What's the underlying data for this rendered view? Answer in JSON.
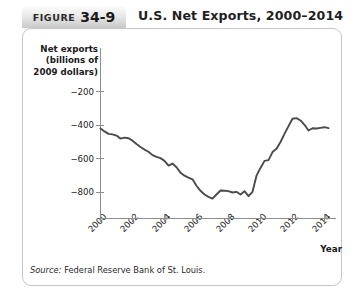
{
  "header": {
    "badge_word": "FIGURE",
    "badge_number": "34-9",
    "title": "U.S. Net Exports, 2000–2014"
  },
  "source": {
    "prefix": "Source:",
    "text": "Federal Reserve Bank of St. Louis."
  },
  "colors": {
    "line": "#4b4b4b",
    "axis": "#8e8e8e",
    "panel_border": "#c4c4c4",
    "badge_top": "#fcfcfc",
    "badge_bottom": "#c9c9c9",
    "text": "#1a1a1a"
  },
  "chart_data": {
    "type": "line",
    "title": "U.S. Net Exports, 2000–2014",
    "xlabel": "Year",
    "ylabel": "Net exports (billions of 2009 dollars)",
    "ylabel_lines": [
      "Net exports",
      "(billions of",
      "2009 dollars)"
    ],
    "grid": false,
    "legend": null,
    "xlim": [
      2000,
      2014.25
    ],
    "ylim": [
      -900,
      -120
    ],
    "xticks": [
      2000,
      2002,
      2004,
      2006,
      2008,
      2010,
      2012,
      2014
    ],
    "xtick_labels": [
      "2000",
      "2002",
      "2004",
      "2006",
      "2008",
      "2010",
      "2012",
      "2014"
    ],
    "yticks": [
      -200,
      -400,
      -600,
      -800
    ],
    "ytick_labels": [
      "−200",
      "−400",
      "−600",
      "−800"
    ],
    "series": [
      {
        "name": "U.S. net exports",
        "x": [
          2000.0,
          2000.25,
          2000.5,
          2000.75,
          2001.0,
          2001.25,
          2001.5,
          2001.75,
          2002.0,
          2002.25,
          2002.5,
          2002.75,
          2003.0,
          2003.25,
          2003.5,
          2003.75,
          2004.0,
          2004.25,
          2004.5,
          2004.75,
          2005.0,
          2005.25,
          2005.5,
          2005.75,
          2006.0,
          2006.25,
          2006.5,
          2006.75,
          2007.0,
          2007.25,
          2007.5,
          2007.75,
          2008.0,
          2008.25,
          2008.5,
          2008.75,
          2009.0,
          2009.25,
          2009.5,
          2009.75,
          2010.0,
          2010.25,
          2010.5,
          2010.75,
          2011.0,
          2011.25,
          2011.5,
          2011.75,
          2012.0,
          2012.25,
          2012.5,
          2012.75,
          2013.0,
          2013.25,
          2013.5,
          2013.75,
          2014.0,
          2014.25
        ],
        "y": [
          -420,
          -437,
          -452,
          -455,
          -462,
          -480,
          -474,
          -478,
          -492,
          -512,
          -530,
          -545,
          -558,
          -578,
          -588,
          -596,
          -612,
          -640,
          -628,
          -650,
          -682,
          -700,
          -712,
          -722,
          -760,
          -790,
          -812,
          -826,
          -836,
          -812,
          -788,
          -790,
          -792,
          -800,
          -796,
          -812,
          -792,
          -822,
          -796,
          -700,
          -654,
          -612,
          -608,
          -560,
          -540,
          -500,
          -452,
          -406,
          -362,
          -358,
          -372,
          -398,
          -432,
          -418,
          -420,
          -416,
          -412,
          -418
        ]
      }
    ],
    "annotations": []
  }
}
